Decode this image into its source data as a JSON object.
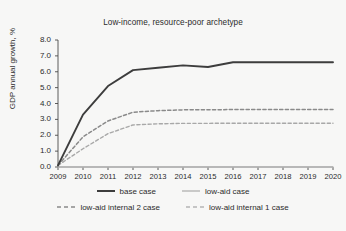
{
  "chart_data": {
    "type": "line",
    "title": "Low-income, resource-poor archetype",
    "xlabel": "",
    "ylabel": "GDP annual growth, %",
    "x": [
      2009,
      2010,
      2011,
      2012,
      2013,
      2014,
      2015,
      2016,
      2017,
      2018,
      2019,
      2020
    ],
    "categories": [
      "2009",
      "2010",
      "2011",
      "2012",
      "2013",
      "2014",
      "2015",
      "2016",
      "2017",
      "2018",
      "2019",
      "2020"
    ],
    "xlim": [
      2009,
      2020
    ],
    "ylim": [
      0.0,
      8.0
    ],
    "ytick_labels": [
      "0.0",
      "1.0",
      "2.0",
      "3.0",
      "4.0",
      "5.0",
      "6.0",
      "7.0",
      "8.0"
    ],
    "ytick_values": [
      0.0,
      1.0,
      2.0,
      3.0,
      4.0,
      5.0,
      6.0,
      7.0,
      8.0
    ],
    "grid": false,
    "legend_position": "bottom",
    "series": [
      {
        "name": "base case",
        "style": "solid",
        "color": "#3d3d3d",
        "width": 1.9,
        "values": [
          0.1,
          3.3,
          5.1,
          6.1,
          6.25,
          6.4,
          6.3,
          6.6,
          6.6,
          6.6,
          6.6,
          6.6
        ]
      },
      {
        "name": "low-aid internal 2 case",
        "style": "dashed",
        "color": "#8a8a8a",
        "width": 1.5,
        "values": [
          0.1,
          1.9,
          2.9,
          3.45,
          3.55,
          3.6,
          3.6,
          3.62,
          3.62,
          3.62,
          3.62,
          3.62
        ]
      },
      {
        "name": "low-aid internal 1 case",
        "style": "dashed",
        "color": "#a8a8a8",
        "width": 1.4,
        "values": [
          0.1,
          1.15,
          2.1,
          2.65,
          2.72,
          2.75,
          2.75,
          2.76,
          2.76,
          2.76,
          2.76,
          2.76
        ]
      },
      {
        "name": "low-aid case",
        "style": "solid",
        "color": "#bdbdbd",
        "width": 1.5,
        "values": [
          0.0,
          0.0,
          0.0,
          0.0,
          0.0,
          0.0,
          0.0,
          0.0,
          0.0,
          0.0,
          0.0,
          0.0
        ]
      }
    ]
  },
  "legend": {
    "rows": [
      [
        {
          "label": "base case",
          "style": "solid",
          "color": "#3d3d3d",
          "width": 2.0
        },
        {
          "label": "low-aid case",
          "style": "solid",
          "color": "#bdbdbd",
          "width": 1.6
        }
      ],
      [
        {
          "label": "low-aid internal 2 case",
          "style": "dashed",
          "color": "#8a8a8a",
          "width": 1.5
        },
        {
          "label": "low-aid internal 1 case",
          "style": "dashed",
          "color": "#b5b5b5",
          "width": 1.4
        }
      ]
    ]
  },
  "colors": {
    "background": "#f7f7f6",
    "axis": "#4a4a4a",
    "text": "#2b2b2b"
  }
}
